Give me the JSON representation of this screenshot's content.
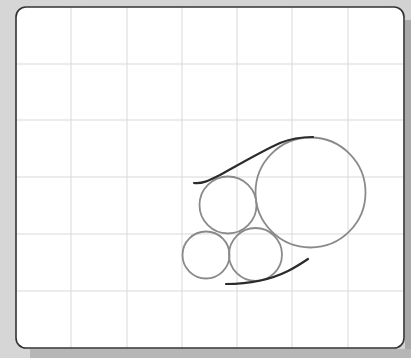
{
  "diagram": {
    "type": "geometry-figure",
    "frame": {
      "x": 16,
      "y": 7,
      "width": 388,
      "height": 341,
      "radius": 10,
      "stroke": "#333333",
      "fill": "#ffffff"
    },
    "grid": {
      "color": "#d9d9d9",
      "vertical_x": [
        71,
        127,
        182,
        237,
        292,
        348
      ],
      "horizontal_y": [
        64,
        120,
        177,
        234,
        291
      ]
    },
    "circles": [
      {
        "name": "large-circle",
        "cx": 310.5,
        "cy": 192.5,
        "r": 55,
        "stroke": "#8a8a8a"
      },
      {
        "name": "upper-middle-circle",
        "cx": 228,
        "cy": 205,
        "r": 28.5,
        "stroke": "#8a8a8a"
      },
      {
        "name": "bottom-left-circle",
        "cx": 206,
        "cy": 255,
        "r": 23.5,
        "stroke": "#8a8a8a"
      },
      {
        "name": "bottom-middle-circle",
        "cx": 255.5,
        "cy": 254.5,
        "r": 26.5,
        "stroke": "#8a8a8a"
      }
    ],
    "curves": [
      {
        "name": "upper-tangent-curve",
        "path": "M194,183 C202,184 208,181 220,175 C240,164 262,151 280,143 C292,138 302,137 313,137",
        "stroke": "#2b2b2b"
      },
      {
        "name": "lower-tangent-curve",
        "path": "M226,284 C250,284 272,279 288,271 C296,267 302,263 308,259",
        "stroke": "#2b2b2b"
      }
    ],
    "colors": {
      "background": "#d4d4d4",
      "canvas": "#ffffff",
      "grid": "#d9d9d9",
      "circle": "#8a8a8a",
      "curve": "#2b2b2b",
      "frame": "#333333"
    }
  }
}
